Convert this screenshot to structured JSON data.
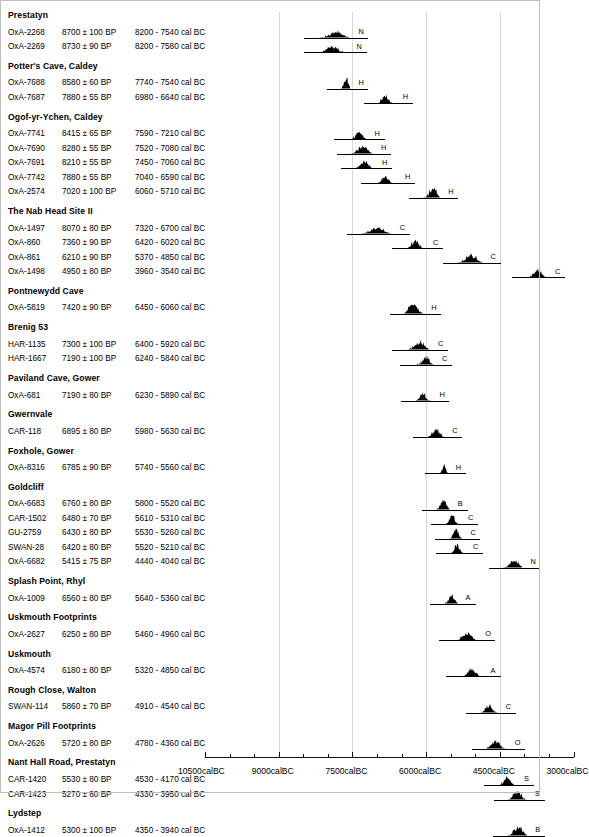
{
  "chart_data": {
    "type": "area",
    "title": "",
    "xlabel": "",
    "ylabel": "",
    "axis": {
      "major_ticks": [
        "10500calBC",
        "9000calBC",
        "7500calBC",
        "6000calBC",
        "4500calBC",
        "3000calBC"
      ],
      "major_values": [
        -10500,
        -9000,
        -7500,
        -6000,
        -4500,
        -3000
      ],
      "minor_tick_interval": 500,
      "xlim": [
        -11000,
        -3000
      ],
      "grid": true,
      "direction": "older-left"
    },
    "columns": [
      "lab_code",
      "bp_date",
      "cal_range"
    ],
    "groups": [
      {
        "site": "Prestatyn",
        "entries": [
          {
            "lab_code": "OxA-2268",
            "bp_date": "8700 ± 100 BP",
            "cal_range": "8200 - 7540 cal BC",
            "code": "N",
            "start": -8200,
            "end": -7540,
            "peak": 0.62
          },
          {
            "lab_code": "OxA-2269",
            "bp_date": "8730 ± 90 BP",
            "cal_range": "8200 - 7580 cal BC",
            "code": "N",
            "start": -8200,
            "end": -7580,
            "peak": 0.6
          }
        ]
      },
      {
        "site": "Potter's Cave, Caldey",
        "entries": [
          {
            "lab_code": "OxA-7688",
            "bp_date": "8580 ± 60 BP",
            "cal_range": "7740 - 7540 cal BC",
            "code": "H",
            "start": -7740,
            "end": -7540,
            "peak": 0.95
          },
          {
            "lab_code": "OxA-7687",
            "bp_date": "7880 ± 55 BP",
            "cal_range": "6980 - 6640 cal BC",
            "code": "H",
            "start": -6980,
            "end": -6640,
            "peak": 0.8
          }
        ]
      },
      {
        "site": "Ogof-yr-Ychen, Caldey",
        "entries": [
          {
            "lab_code": "OxA-7741",
            "bp_date": "8415 ± 65 BP",
            "cal_range": "7590 - 7210 cal BC",
            "code": "H",
            "start": -7590,
            "end": -7210,
            "peak": 0.72
          },
          {
            "lab_code": "OxA-7690",
            "bp_date": "8280 ± 55 BP",
            "cal_range": "7520 - 7080 cal BC",
            "code": "H",
            "start": -7520,
            "end": -7080,
            "peak": 0.7
          },
          {
            "lab_code": "OxA-7691",
            "bp_date": "8210 ± 55 BP",
            "cal_range": "7450 - 7060 cal BC",
            "code": "H",
            "start": -7450,
            "end": -7060,
            "peak": 0.72
          },
          {
            "lab_code": "OxA-7742",
            "bp_date": "7880 ± 55 BP",
            "cal_range": "7040 - 6590 cal BC",
            "code": "H",
            "start": -7040,
            "end": -6590,
            "peak": 0.68
          },
          {
            "lab_code": "OxA-2574",
            "bp_date": "7020 ± 100 BP",
            "cal_range": "6060 - 5710 cal BC",
            "code": "H",
            "start": -6060,
            "end": -5710,
            "peak": 0.88
          }
        ]
      },
      {
        "site": "The Nab Head Site II",
        "entries": [
          {
            "lab_code": "OxA-1497",
            "bp_date": "8070 ± 80 BP",
            "cal_range": "7320 - 6700 cal BC",
            "code": "C",
            "start": -7320,
            "end": -6700,
            "peak": 0.55
          },
          {
            "lab_code": "OxA-860",
            "bp_date": "7360 ± 90 BP",
            "cal_range": "6420 - 6020 cal BC",
            "code": "C",
            "start": -6420,
            "end": -6020,
            "peak": 0.78
          },
          {
            "lab_code": "OxA-861",
            "bp_date": "6210 ± 90 BP",
            "cal_range": "5370 - 4850 cal BC",
            "code": "C",
            "start": -5370,
            "end": -4850,
            "peak": 0.8
          },
          {
            "lab_code": "OxA-1498",
            "bp_date": "4950 ± 80 BP",
            "cal_range": "3960 - 3540 cal BC",
            "code": "C",
            "start": -3960,
            "end": -3540,
            "peak": 0.8
          }
        ]
      },
      {
        "site": "Pontnewydd Cave",
        "entries": [
          {
            "lab_code": "OxA-5819",
            "bp_date": "7420 ± 90 BP",
            "cal_range": "6450 - 6060 cal BC",
            "code": "H",
            "start": -6450,
            "end": -6060,
            "peak": 0.82
          }
        ]
      },
      {
        "site": "Brenig 53",
        "entries": [
          {
            "lab_code": "HAR-1135",
            "bp_date": "7300 ± 100 BP",
            "cal_range": "6400 - 5920 cal BC",
            "code": "C",
            "start": -6400,
            "end": -5920,
            "peak": 0.8
          },
          {
            "lab_code": "HAR-1667",
            "bp_date": "7190 ± 100 BP",
            "cal_range": "6240 - 5840 cal BC",
            "code": "C",
            "start": -6240,
            "end": -5840,
            "peak": 0.78
          }
        ]
      },
      {
        "site": "Paviland Cave, Gower",
        "entries": [
          {
            "lab_code": "OxA-681",
            "bp_date": "7190 ± 80 BP",
            "cal_range": "6230 - 5890 cal BC",
            "code": "H",
            "start": -6230,
            "end": -5890,
            "peak": 0.72
          }
        ]
      },
      {
        "site": "Gwernvale",
        "entries": [
          {
            "lab_code": "CAR-118",
            "bp_date": "6895 ± 80 BP",
            "cal_range": "5980 - 5630 cal BC",
            "code": "C",
            "start": -5980,
            "end": -5630,
            "peak": 0.8
          }
        ]
      },
      {
        "site": "Foxhole, Gower",
        "entries": [
          {
            "lab_code": "OxA-8316",
            "bp_date": "6785 ± 90 BP",
            "cal_range": "5740 - 5560 cal BC",
            "code": "H",
            "start": -5740,
            "end": -5560,
            "peak": 0.85
          }
        ]
      },
      {
        "site": "Goldcliff",
        "entries": [
          {
            "lab_code": "OxA-6683",
            "bp_date": "6760 ± 80 BP",
            "cal_range": "5800 - 5520 cal BC",
            "code": "B",
            "start": -5800,
            "end": -5520,
            "peak": 0.85
          },
          {
            "lab_code": "CAR-1502",
            "bp_date": "6480 ± 70 BP",
            "cal_range": "5610 - 5310 cal BC",
            "code": "C",
            "start": -5610,
            "end": -5310,
            "peak": 0.8
          },
          {
            "lab_code": "GU-2759",
            "bp_date": "6430 ± 80 BP",
            "cal_range": "5530 - 5260 cal BC",
            "code": "C",
            "start": -5530,
            "end": -5260,
            "peak": 0.88
          },
          {
            "lab_code": "SWAN-28",
            "bp_date": "6420 ± 80 BP",
            "cal_range": "5520 - 5210 cal BC",
            "code": "C",
            "start": -5520,
            "end": -5210,
            "peak": 0.88
          },
          {
            "lab_code": "OxA-6682",
            "bp_date": "5415 ± 75 BP",
            "cal_range": "4440 - 4040 cal BC",
            "code": "N",
            "start": -4440,
            "end": -4040,
            "peak": 0.62
          }
        ]
      },
      {
        "site": "Splash Point, Rhyl",
        "entries": [
          {
            "lab_code": "OxA-1009",
            "bp_date": "6560 ± 80 BP",
            "cal_range": "5640 - 5360 cal BC",
            "code": "A",
            "start": -5640,
            "end": -5360,
            "peak": 0.8
          }
        ]
      },
      {
        "site": "Uskmouth Footprints",
        "entries": [
          {
            "lab_code": "OxA-2627",
            "bp_date": "6250 ± 80 BP",
            "cal_range": "5460 - 4960 cal BC",
            "code": "O",
            "start": -5460,
            "end": -4960,
            "peak": 0.72
          }
        ]
      },
      {
        "site": "Uskmouth",
        "entries": [
          {
            "lab_code": "OxA-4574",
            "bp_date": "6180 ± 80 BP",
            "cal_range": "5320 - 4850 cal BC",
            "code": "A",
            "start": -5320,
            "end": -4850,
            "peak": 0.78
          }
        ]
      },
      {
        "site": "Rough Close, Walton",
        "entries": [
          {
            "lab_code": "SWAN-114",
            "bp_date": "5860 ± 70 BP",
            "cal_range": "4910 - 4540 cal BC",
            "code": "C",
            "start": -4910,
            "end": -4540,
            "peak": 0.75
          }
        ]
      },
      {
        "site": "Magor Pill Footprints",
        "entries": [
          {
            "lab_code": "OxA-2626",
            "bp_date": "5720 ± 80 BP",
            "cal_range": "4780 - 4360 cal BC",
            "code": "O",
            "start": -4780,
            "end": -4360,
            "peak": 0.72
          }
        ]
      },
      {
        "site": "Nant Hall Road, Prestatyn",
        "entries": [
          {
            "lab_code": "CAR-1420",
            "bp_date": "5530 ± 80 BP",
            "cal_range": "4530 - 4170 cal BC",
            "code": "S",
            "start": -4530,
            "end": -4170,
            "peak": 0.8
          },
          {
            "lab_code": "CAR-1423",
            "bp_date": "5270 ± 80 BP",
            "cal_range": "4330 - 3950 cal BC",
            "code": "S",
            "start": -4330,
            "end": -3950,
            "peak": 0.78
          }
        ]
      },
      {
        "site": "Lydstep",
        "entries": [
          {
            "lab_code": "OxA-1412",
            "bp_date": "5300 ± 100 BP",
            "cal_range": "4350 - 3940 cal BC",
            "code": "B",
            "start": -4350,
            "end": -3940,
            "peak": 0.8
          }
        ]
      }
    ]
  }
}
